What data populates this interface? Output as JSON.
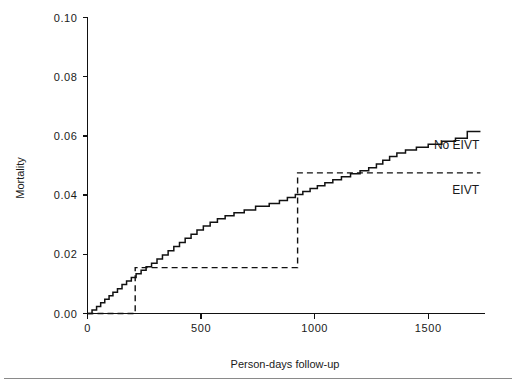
{
  "chart_data": {
    "type": "line",
    "title": "",
    "xlabel": "Person-days follow-up",
    "ylabel": "Mortality",
    "xlim": [
      0,
      1750
    ],
    "ylim": [
      0.0,
      0.1
    ],
    "xticks": [
      0,
      500,
      1000,
      1500
    ],
    "xtick_labels": [
      "0",
      "500",
      "1000",
      "1500"
    ],
    "yticks": [
      0.0,
      0.02,
      0.04,
      0.06,
      0.08,
      0.1
    ],
    "ytick_labels": [
      "0.00",
      "0.02",
      "0.04",
      "0.06",
      "0.08",
      "0.10"
    ],
    "grid": false,
    "legend_position": "inline-right",
    "series": [
      {
        "name": "No EIVT",
        "style": "solid-step",
        "label": "No EIVT",
        "label_x": 1625,
        "label_y": 0.0555,
        "points": [
          [
            0,
            0.0
          ],
          [
            20,
            0.0
          ],
          [
            20,
            0.0012
          ],
          [
            40,
            0.0012
          ],
          [
            40,
            0.0024
          ],
          [
            58,
            0.0024
          ],
          [
            58,
            0.0036
          ],
          [
            76,
            0.0036
          ],
          [
            76,
            0.0048
          ],
          [
            95,
            0.0048
          ],
          [
            95,
            0.006
          ],
          [
            112,
            0.006
          ],
          [
            112,
            0.0072
          ],
          [
            132,
            0.0072
          ],
          [
            132,
            0.0084
          ],
          [
            152,
            0.0084
          ],
          [
            152,
            0.0098
          ],
          [
            172,
            0.0098
          ],
          [
            172,
            0.011
          ],
          [
            193,
            0.011
          ],
          [
            193,
            0.0122
          ],
          [
            214,
            0.0122
          ],
          [
            214,
            0.0134
          ],
          [
            236,
            0.0134
          ],
          [
            236,
            0.0146
          ],
          [
            258,
            0.0146
          ],
          [
            258,
            0.0158
          ],
          [
            282,
            0.0158
          ],
          [
            282,
            0.017
          ],
          [
            306,
            0.017
          ],
          [
            306,
            0.0184
          ],
          [
            330,
            0.0184
          ],
          [
            330,
            0.0198
          ],
          [
            355,
            0.0198
          ],
          [
            355,
            0.0212
          ],
          [
            380,
            0.0212
          ],
          [
            380,
            0.0226
          ],
          [
            405,
            0.0226
          ],
          [
            405,
            0.024
          ],
          [
            430,
            0.024
          ],
          [
            430,
            0.0254
          ],
          [
            456,
            0.0254
          ],
          [
            456,
            0.0268
          ],
          [
            482,
            0.0268
          ],
          [
            482,
            0.0282
          ],
          [
            510,
            0.0282
          ],
          [
            510,
            0.0296
          ],
          [
            540,
            0.0296
          ],
          [
            540,
            0.0308
          ],
          [
            572,
            0.0308
          ],
          [
            572,
            0.032
          ],
          [
            606,
            0.032
          ],
          [
            606,
            0.033
          ],
          [
            645,
            0.033
          ],
          [
            645,
            0.034
          ],
          [
            690,
            0.034
          ],
          [
            690,
            0.035
          ],
          [
            740,
            0.035
          ],
          [
            740,
            0.0362
          ],
          [
            800,
            0.0362
          ],
          [
            800,
            0.0372
          ],
          [
            845,
            0.0372
          ],
          [
            845,
            0.0382
          ],
          [
            880,
            0.0382
          ],
          [
            880,
            0.0392
          ],
          [
            915,
            0.0392
          ],
          [
            915,
            0.0402
          ],
          [
            948,
            0.0402
          ],
          [
            948,
            0.0412
          ],
          [
            980,
            0.0412
          ],
          [
            980,
            0.0422
          ],
          [
            1012,
            0.0422
          ],
          [
            1012,
            0.0432
          ],
          [
            1045,
            0.0432
          ],
          [
            1045,
            0.0442
          ],
          [
            1080,
            0.0442
          ],
          [
            1080,
            0.0452
          ],
          [
            1118,
            0.0452
          ],
          [
            1118,
            0.0462
          ],
          [
            1158,
            0.0462
          ],
          [
            1158,
            0.0472
          ],
          [
            1200,
            0.0472
          ],
          [
            1200,
            0.0482
          ],
          [
            1238,
            0.0482
          ],
          [
            1238,
            0.0492
          ],
          [
            1272,
            0.0492
          ],
          [
            1272,
            0.0505
          ],
          [
            1300,
            0.0505
          ],
          [
            1300,
            0.0518
          ],
          [
            1330,
            0.0518
          ],
          [
            1330,
            0.053
          ],
          [
            1362,
            0.053
          ],
          [
            1362,
            0.0542
          ],
          [
            1400,
            0.0542
          ],
          [
            1400,
            0.0552
          ],
          [
            1448,
            0.0552
          ],
          [
            1448,
            0.0562
          ],
          [
            1500,
            0.0562
          ],
          [
            1500,
            0.0572
          ],
          [
            1560,
            0.0572
          ],
          [
            1560,
            0.0582
          ],
          [
            1620,
            0.0582
          ],
          [
            1620,
            0.0592
          ],
          [
            1672,
            0.0592
          ],
          [
            1672,
            0.0615
          ],
          [
            1730,
            0.0615
          ]
        ]
      },
      {
        "name": "EIVT",
        "style": "dashed-step",
        "label": "EIVT",
        "label_x": 1665,
        "label_y": 0.0405,
        "points": [
          [
            0,
            0.0
          ],
          [
            210,
            0.0
          ],
          [
            210,
            0.0155
          ],
          [
            925,
            0.0155
          ],
          [
            925,
            0.0475
          ],
          [
            1730,
            0.0475
          ]
        ]
      }
    ]
  },
  "annotations": {
    "footer_rule": true
  }
}
